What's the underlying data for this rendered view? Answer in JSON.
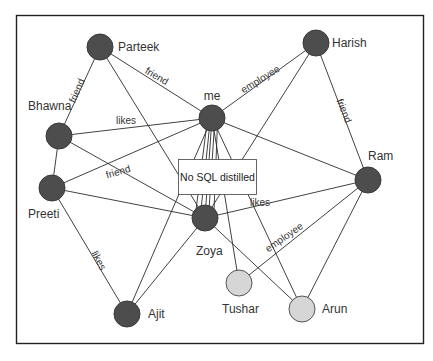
{
  "diagram": {
    "title": "No SQL distilled",
    "colors": {
      "frame": "#222222",
      "node_dark": "#4d4d4d",
      "node_light": "#d6d6d6",
      "edge": "#2b2b2b",
      "text": "#333333"
    },
    "nodes": [
      {
        "id": "parteek",
        "label": "Parteek",
        "x": 100,
        "y": 47,
        "r": 13,
        "type": "dark",
        "lx": 118,
        "ly": 51,
        "anchor": "start"
      },
      {
        "id": "harish",
        "label": "Harish",
        "x": 316,
        "y": 43,
        "r": 13,
        "type": "dark",
        "lx": 332,
        "ly": 47,
        "anchor": "start"
      },
      {
        "id": "me",
        "label": "me",
        "x": 212,
        "y": 118,
        "r": 13,
        "type": "dark",
        "lx": 212,
        "ly": 100,
        "anchor": "middle"
      },
      {
        "id": "bhawna",
        "label": "Bhawna",
        "x": 59,
        "y": 136,
        "r": 13,
        "type": "dark",
        "lx": 28,
        "ly": 110,
        "anchor": "start"
      },
      {
        "id": "preeti",
        "label": "Preeti",
        "x": 52,
        "y": 188,
        "r": 13,
        "type": "dark",
        "lx": 28,
        "ly": 218,
        "anchor": "start"
      },
      {
        "id": "ram",
        "label": "Ram",
        "x": 368,
        "y": 180,
        "r": 13,
        "type": "dark",
        "lx": 368,
        "ly": 160,
        "anchor": "start"
      },
      {
        "id": "zoya",
        "label": "Zoya",
        "x": 205,
        "y": 218,
        "r": 13,
        "type": "dark",
        "lx": 196,
        "ly": 255,
        "anchor": "start"
      },
      {
        "id": "ajit",
        "label": "Ajit",
        "x": 127,
        "y": 314,
        "r": 13,
        "type": "dark",
        "lx": 148,
        "ly": 318,
        "anchor": "start"
      },
      {
        "id": "tushar",
        "label": "Tushar",
        "x": 239,
        "y": 283,
        "r": 13,
        "type": "light",
        "lx": 222,
        "ly": 313,
        "anchor": "start"
      },
      {
        "id": "arun",
        "label": "Arun",
        "x": 302,
        "y": 309,
        "r": 13,
        "type": "light",
        "lx": 322,
        "ly": 313,
        "anchor": "start"
      }
    ],
    "central_box": {
      "label": "No SQL distilled",
      "x": 178,
      "y": 159,
      "w": 78,
      "h": 35
    },
    "edges": [
      {
        "from": "parteek",
        "to": "bhawna",
        "label": "friend"
      },
      {
        "from": "parteek",
        "to": "me",
        "label": "friend"
      },
      {
        "from": "parteek",
        "to": "zoya",
        "label": ""
      },
      {
        "from": "harish",
        "to": "me",
        "label": "employee"
      },
      {
        "from": "harish",
        "to": "zoya",
        "label": ""
      },
      {
        "from": "harish",
        "to": "ram",
        "label": "friend"
      },
      {
        "from": "bhawna",
        "to": "me",
        "label": "likes"
      },
      {
        "from": "bhawna",
        "to": "preeti",
        "label": ""
      },
      {
        "from": "bhawna",
        "to": "zoya",
        "label": ""
      },
      {
        "from": "preeti",
        "to": "me",
        "label": "friend"
      },
      {
        "from": "preeti",
        "to": "zoya",
        "label": ""
      },
      {
        "from": "preeti",
        "to": "ajit",
        "label": "likes"
      },
      {
        "from": "me",
        "to": "ram",
        "label": ""
      },
      {
        "from": "me",
        "to": "ajit",
        "label": ""
      },
      {
        "from": "me",
        "to": "zoya",
        "label": ""
      },
      {
        "from": "me",
        "to": "tushar",
        "label": ""
      },
      {
        "from": "me",
        "to": "arun",
        "label": ""
      },
      {
        "from": "ram",
        "to": "zoya",
        "label": "likes"
      },
      {
        "from": "ram",
        "to": "tushar",
        "label": "employee"
      },
      {
        "from": "ram",
        "to": "arun",
        "label": ""
      },
      {
        "from": "zoya",
        "to": "ajit",
        "label": ""
      },
      {
        "from": "zoya",
        "to": "arun",
        "label": ""
      }
    ],
    "edge_labels": [
      {
        "text": "friend",
        "x": 80,
        "y": 92,
        "rotate": -67
      },
      {
        "text": "friend",
        "x": 155,
        "y": 79,
        "rotate": 30
      },
      {
        "text": "employee",
        "x": 262,
        "y": 82,
        "rotate": -32
      },
      {
        "text": "friend",
        "x": 341,
        "y": 112,
        "rotate": 68
      },
      {
        "text": "likes",
        "x": 126,
        "y": 124,
        "rotate": 0
      },
      {
        "text": "friend",
        "x": 119,
        "y": 175,
        "rotate": -16
      },
      {
        "text": "likes",
        "x": 96,
        "y": 262,
        "rotate": 62
      },
      {
        "text": "likes",
        "x": 260,
        "y": 206,
        "rotate": 0
      },
      {
        "text": "employee",
        "x": 286,
        "y": 240,
        "rotate": -35
      }
    ]
  }
}
